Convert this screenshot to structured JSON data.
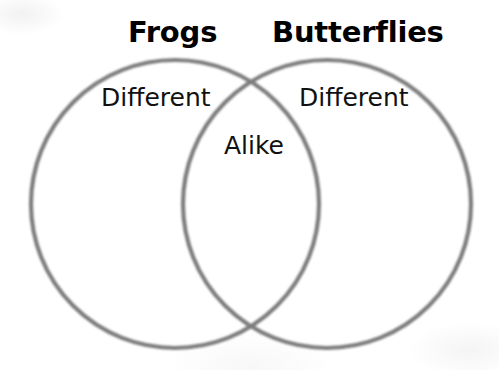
{
  "diagram": {
    "type": "venn",
    "headings": {
      "left": "Frogs",
      "right": "Butterflies"
    },
    "regions": {
      "left_only": "Different",
      "right_only": "Different",
      "intersection": "Alike"
    },
    "colors": {
      "background": "#ffffff",
      "circle_stroke": "#7d7d7d",
      "heading_text": "#000000",
      "label_text": "#111111"
    },
    "geometry": {
      "left_circle": {
        "cx": 175,
        "cy": 204,
        "r": 144
      },
      "right_circle": {
        "cx": 327,
        "cy": 204,
        "r": 144
      },
      "stroke_width": 4.2
    }
  }
}
